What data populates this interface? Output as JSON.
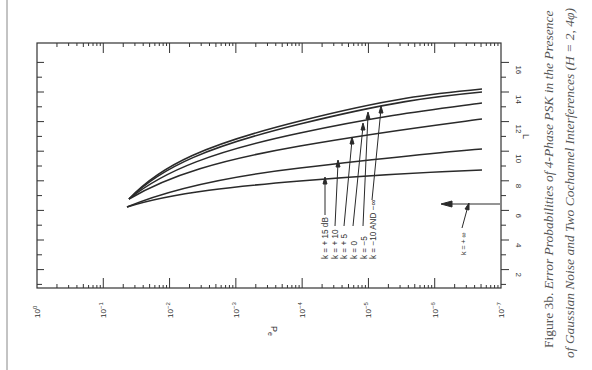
{
  "chart_data": {
    "type": "line",
    "orientation": "rotated 90 degrees clockwise (Pe axis along bottom, L axis along right)",
    "xlabel": "Pe",
    "ylabel": "L",
    "x_scale": "log",
    "x_ticks": [
      "10^0",
      "10^-1",
      "10^-2",
      "10^-3",
      "10^-4",
      "10^-5",
      "10^-6",
      "10^-7"
    ],
    "x_range": [
      1,
      1e-07
    ],
    "y_ticks": [
      2,
      4,
      6,
      8,
      10,
      12,
      14,
      16
    ],
    "y_range": [
      0,
      17
    ],
    "grid": false,
    "series": [
      {
        "name": "k = +15 dB",
        "points": [
          [
            0.015,
            6.2
          ],
          [
            0.001,
            7.3
          ],
          [
            0.0001,
            7.9
          ],
          [
            1e-05,
            8.3
          ],
          [
            1e-06,
            8.5
          ],
          [
            1.5e-07,
            8.7
          ]
        ]
      },
      {
        "name": "k = +10",
        "points": [
          [
            0.015,
            6.2
          ],
          [
            0.001,
            7.8
          ],
          [
            0.0001,
            8.7
          ],
          [
            1e-05,
            9.3
          ],
          [
            1e-06,
            9.7
          ],
          [
            1.5e-07,
            10.1
          ]
        ]
      },
      {
        "name": "k = +5",
        "points": [
          [
            0.013,
            6.8
          ],
          [
            0.001,
            8.9
          ],
          [
            0.0001,
            10.1
          ],
          [
            1e-05,
            11.0
          ],
          [
            1e-06,
            11.7
          ],
          [
            1.5e-07,
            12.2
          ]
        ]
      },
      {
        "name": "k = 0",
        "points": [
          [
            0.013,
            6.8
          ],
          [
            0.001,
            9.4
          ],
          [
            0.0001,
            10.8
          ],
          [
            1e-05,
            11.9
          ],
          [
            1e-06,
            12.7
          ],
          [
            1.5e-07,
            13.3
          ]
        ]
      },
      {
        "name": "k = -5",
        "points": [
          [
            0.013,
            6.8
          ],
          [
            0.001,
            9.8
          ],
          [
            0.0001,
            11.4
          ],
          [
            1e-05,
            12.6
          ],
          [
            1e-06,
            13.4
          ],
          [
            1.5e-07,
            14.0
          ]
        ]
      },
      {
        "name": "k = -10 AND -∞",
        "points": [
          [
            0.013,
            6.8
          ],
          [
            0.001,
            9.9
          ],
          [
            0.0001,
            11.6
          ],
          [
            1e-05,
            12.8
          ],
          [
            1e-06,
            13.6
          ],
          [
            1.5e-07,
            14.2
          ]
        ]
      }
    ],
    "annotations": [
      {
        "text": "k = + 15 dB",
        "target_series": "k = +15 dB"
      },
      {
        "text": "k = + 10",
        "target_series": "k = +10"
      },
      {
        "text": "k = + 5",
        "target_series": "k = +5"
      },
      {
        "text": "k = 0",
        "target_series": "k = 0"
      },
      {
        "text": "k = −5",
        "target_series": "k = -5"
      },
      {
        "text": "k = −10 AND −∞",
        "target_series": "k = -10 AND -∞"
      },
      {
        "text": "k = + ∞",
        "note": "arrow pointing to asymptote at L ≈ 6.4"
      }
    ]
  },
  "labels": {
    "xlabel": "Pe",
    "xlabel_main": "P",
    "xlabel_sub": "e",
    "ylabel": "L",
    "x_ticks": [
      {
        "base": "10",
        "exp": "0"
      },
      {
        "base": "10",
        "exp": "−1"
      },
      {
        "base": "10",
        "exp": "−2"
      },
      {
        "base": "10",
        "exp": "−3"
      },
      {
        "base": "10",
        "exp": "−4"
      },
      {
        "base": "10",
        "exp": "−5"
      },
      {
        "base": "10",
        "exp": "−6"
      },
      {
        "base": "10",
        "exp": "−7"
      }
    ],
    "y_ticks": [
      "2",
      "4",
      "6",
      "8",
      "10",
      "12",
      "14",
      "16"
    ],
    "k_labels": [
      "k = + 15 dB",
      "k = + 10",
      "k = + 5",
      "k = 0",
      "k = −5",
      "k = −10 AND −∞"
    ],
    "k_inf_label": "k = + ∞"
  },
  "caption": {
    "figure": "Figure 3b.",
    "line1": "Error Probabilities of 4-Phase PSK in the Presence",
    "line2": "of Gaussian Noise and Two Cochannel Interferences (H = 2, 4φ)"
  }
}
